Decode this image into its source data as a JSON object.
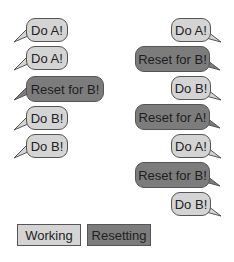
{
  "colors": {
    "working": "#d4d4d4",
    "resetting": "#7c7c7c",
    "border": "#555555"
  },
  "left_column": [
    {
      "text": "Do A!",
      "type": "working"
    },
    {
      "text": "Do A!",
      "type": "working"
    },
    {
      "text": "Reset for B!",
      "type": "resetting"
    },
    {
      "text": "Do B!",
      "type": "working"
    },
    {
      "text": "Do B!",
      "type": "working"
    }
  ],
  "right_column": [
    {
      "text": "Do A!",
      "type": "working"
    },
    {
      "text": "Reset for B!",
      "type": "resetting"
    },
    {
      "text": "Do B!",
      "type": "working"
    },
    {
      "text": "Reset for A!",
      "type": "resetting"
    },
    {
      "text": "Do A!",
      "type": "working"
    },
    {
      "text": "Reset for B!",
      "type": "resetting"
    },
    {
      "text": "Do B!",
      "type": "working"
    }
  ],
  "legend": [
    {
      "label": "Working",
      "type": "working"
    },
    {
      "label": "Resetting",
      "type": "resetting"
    }
  ]
}
